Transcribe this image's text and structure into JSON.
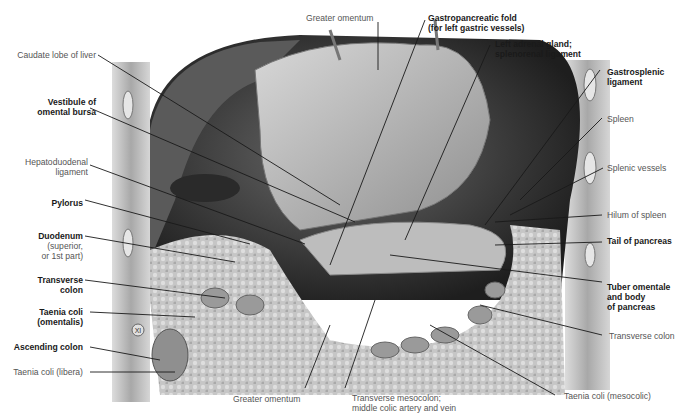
{
  "figure": {
    "labels_left": [
      {
        "id": "caudate",
        "lines": [
          "Caudate lobe of liver"
        ],
        "bold": false
      },
      {
        "id": "vestibule",
        "lines": [
          "Vestibule of",
          "omental bursa"
        ],
        "bold": true
      },
      {
        "id": "hepatoduodenal",
        "lines": [
          "Hepatoduodenal",
          "ligament"
        ],
        "bold": false
      },
      {
        "id": "pylorus",
        "lines": [
          "Pylorus"
        ],
        "bold": true
      },
      {
        "id": "duodenum",
        "lines": [
          "Duodenum"
        ],
        "bold": true
      },
      {
        "id": "duodenum_sub",
        "lines": [
          "(superior,",
          "or 1st part)"
        ],
        "bold": false
      },
      {
        "id": "transverse_colon_l",
        "lines": [
          "Transverse",
          "colon"
        ],
        "bold": true
      },
      {
        "id": "taenia_omentalis",
        "lines": [
          "Taenia coli",
          "(omentalis)"
        ],
        "bold": true
      },
      {
        "id": "ascending_colon",
        "lines": [
          "Ascending colon"
        ],
        "bold": true
      },
      {
        "id": "taenia_libera",
        "lines": [
          "Taenia coli (libera)"
        ],
        "bold": false
      }
    ],
    "labels_top": [
      {
        "id": "greater_omentum_top",
        "lines": [
          "Greater omentum"
        ],
        "bold": false
      },
      {
        "id": "gastropancreatic",
        "lines": [
          "Gastropancreatic fold",
          "(for left gastric vessels)"
        ],
        "bold": true
      },
      {
        "id": "left_adrenal",
        "lines": [
          "Left adrenal gland;",
          "splenorenal ligament"
        ],
        "bold": true
      }
    ],
    "labels_right": [
      {
        "id": "gastrosplenic",
        "lines": [
          "Gastrosplenic",
          "ligament"
        ],
        "bold": true
      },
      {
        "id": "spleen",
        "lines": [
          "Spleen"
        ],
        "bold": false
      },
      {
        "id": "splenic_vessels",
        "lines": [
          "Splenic vessels"
        ],
        "bold": false
      },
      {
        "id": "hilum",
        "lines": [
          "Hilum of spleen"
        ],
        "bold": false
      },
      {
        "id": "tail_pancreas",
        "lines": [
          "Tail of pancreas"
        ],
        "bold": true
      },
      {
        "id": "tuber",
        "lines": [
          "Tuber omentale",
          "and body",
          "of pancreas"
        ],
        "bold": true
      },
      {
        "id": "transverse_colon_r",
        "lines": [
          "Transverse colon"
        ],
        "bold": false
      },
      {
        "id": "taenia_mesocolic",
        "lines": [
          "Taenia coli (mesocolic)"
        ],
        "bold": false
      }
    ],
    "labels_bottom": [
      {
        "id": "greater_omentum_bottom",
        "lines": [
          "Greater omentum"
        ],
        "bold": false
      },
      {
        "id": "mesocolon",
        "lines": [
          "Transverse mesocolon;",
          "middle colic artery and vein"
        ],
        "bold": false
      }
    ],
    "rib_marker": "XI",
    "colors": {
      "background": "#ffffff",
      "leader": "#1a1a1a",
      "dark_cavity": "#3a3a3a",
      "tissue": "#b8b8b8",
      "wall": "#cfcfcf"
    }
  }
}
